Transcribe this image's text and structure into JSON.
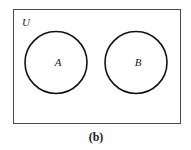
{
  "figure": {
    "caption": "(b)",
    "background_color": "#fefefe",
    "universe": {
      "label": "U",
      "border_color": "#4a4a4a",
      "fill_color": "#ffffff",
      "x": 13,
      "y": 9,
      "width": 168,
      "height": 115,
      "stroke_width": 1,
      "label_x": 26,
      "label_y": 26
    },
    "sets": [
      {
        "label": "A",
        "cx": 56,
        "cy": 62.5,
        "r": 31,
        "stroke_color": "#111111",
        "fill_color": "#ffffff",
        "stroke_width": 1.6,
        "label_x": 58,
        "label_y": 66
      },
      {
        "label": "B",
        "cx": 136,
        "cy": 62.5,
        "r": 31,
        "stroke_color": "#111111",
        "fill_color": "#ffffff",
        "stroke_width": 1.6,
        "label_x": 138,
        "label_y": 66
      }
    ],
    "caption_x": 96,
    "caption_y": 141,
    "relationship": "disjoint"
  }
}
